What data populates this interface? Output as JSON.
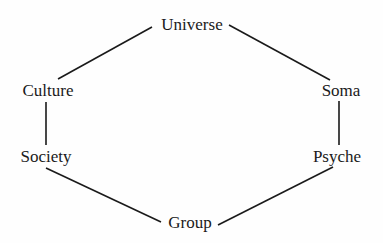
{
  "diagram": {
    "type": "hexagon-cycle",
    "nodes": [
      {
        "id": "universe",
        "label": "Universe",
        "x": 192,
        "y": 24
      },
      {
        "id": "soma",
        "label": "Soma",
        "x": 341,
        "y": 90
      },
      {
        "id": "psyche",
        "label": "Psyche",
        "x": 337,
        "y": 156
      },
      {
        "id": "group",
        "label": "Group",
        "x": 190,
        "y": 222
      },
      {
        "id": "society",
        "label": "Society",
        "x": 46,
        "y": 156
      },
      {
        "id": "culture",
        "label": "Culture",
        "x": 48,
        "y": 90
      }
    ],
    "edges": [
      {
        "from": "universe",
        "to": "culture",
        "x1": 152,
        "y1": 27,
        "x2": 58,
        "y2": 79
      },
      {
        "from": "universe",
        "to": "soma",
        "x1": 229,
        "y1": 25,
        "x2": 330,
        "y2": 80
      },
      {
        "from": "culture",
        "to": "society",
        "x1": 46,
        "y1": 102,
        "x2": 46,
        "y2": 145
      },
      {
        "from": "soma",
        "to": "psyche",
        "x1": 339,
        "y1": 101,
        "x2": 339,
        "y2": 145
      },
      {
        "from": "society",
        "to": "group",
        "x1": 46,
        "y1": 168,
        "x2": 161,
        "y2": 222
      },
      {
        "from": "psyche",
        "to": "group",
        "x1": 333,
        "y1": 167,
        "x2": 218,
        "y2": 225
      }
    ],
    "colors": {
      "line": "#1a1a1a",
      "text": "#1a1a1a",
      "background": "#fefefe"
    }
  }
}
